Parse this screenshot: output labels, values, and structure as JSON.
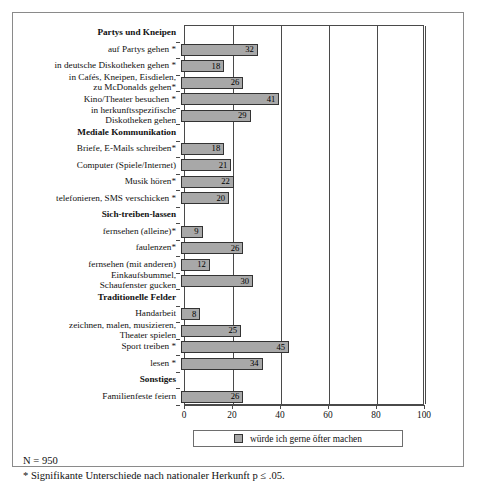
{
  "chart_data": {
    "type": "bar",
    "orientation": "horizontal",
    "title": "",
    "xlabel": "",
    "ylabel": "",
    "xlim": [
      0,
      100
    ],
    "xticks": [
      0,
      20,
      40,
      60,
      80,
      100
    ],
    "grid": true,
    "legend_position": "bottom",
    "legend": [
      "würde ich gerne öfter machen"
    ],
    "series": [
      {
        "name": "würde ich gerne öfter machen",
        "color": "#a8a8a8"
      }
    ],
    "rows": [
      {
        "label": "Partys und Kneipen",
        "type": "header",
        "value": null
      },
      {
        "label": "auf Partys gehen *",
        "type": "bar",
        "value": 32
      },
      {
        "label": "in deutsche Diskotheken gehen *",
        "type": "bar",
        "value": 18
      },
      {
        "label": "in Cafés, Kneipen,  Eisdielen,\nzu McDonalds gehen*",
        "type": "bar",
        "value": 26
      },
      {
        "label": "Kino/Theater besuchen *",
        "type": "bar",
        "value": 41
      },
      {
        "label": "in herkunftsspezifische\nDiskotheken gehen",
        "type": "bar",
        "value": 29
      },
      {
        "label": "Mediale Kommunikation",
        "type": "header",
        "value": null
      },
      {
        "label": "Briefe, E-Mails schreiben*",
        "type": "bar",
        "value": 18
      },
      {
        "label": "Computer (Spiele/Internet)",
        "type": "bar",
        "value": 21
      },
      {
        "label": "Musik hören*",
        "type": "bar",
        "value": 22
      },
      {
        "label": "telefonieren, SMS verschicken *",
        "type": "bar",
        "value": 20
      },
      {
        "label": "Sich-treiben-lassen",
        "type": "header",
        "value": null
      },
      {
        "label": "fernsehen (alleine)*",
        "type": "bar",
        "value": 9
      },
      {
        "label": "faulenzen*",
        "type": "bar",
        "value": 26
      },
      {
        "label": "fernsehen (mit anderen)",
        "type": "bar",
        "value": 12
      },
      {
        "label": "Einkaufsbummel,\nSchaufenster gucken",
        "type": "bar",
        "value": 30
      },
      {
        "label": "Traditionelle Felder",
        "type": "header",
        "value": null
      },
      {
        "label": "Handarbeit",
        "type": "bar",
        "value": 8
      },
      {
        "label": "zeichnen, malen, musizieren,\nTheater spielen",
        "type": "bar",
        "value": 25
      },
      {
        "label": "Sport treiben *",
        "type": "bar",
        "value": 45
      },
      {
        "label": "lesen *",
        "type": "bar",
        "value": 34
      },
      {
        "label": "Sonstiges",
        "type": "header",
        "value": null
      },
      {
        "label": "Familienfeste feiern",
        "type": "bar",
        "value": 26
      }
    ]
  },
  "footnotes": {
    "sample_size": "N = 950",
    "significance": "* Signifikante Unterschiede nach nationaler Herkunft p ≤ .05."
  },
  "colors": {
    "bar_fill": "#a8a8a8",
    "bar_border": "#333333",
    "axis": "#4a4a4a",
    "frame": "#8a8a8a"
  }
}
